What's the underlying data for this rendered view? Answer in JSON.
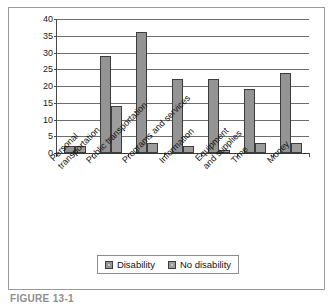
{
  "figure": {
    "caption": "FIGURE  13-1"
  },
  "chart_data": {
    "type": "bar",
    "title": "",
    "xlabel": "",
    "ylabel": "",
    "ylim": [
      0,
      40
    ],
    "ytick_step": 5,
    "ytick_labels": [
      "40",
      "35",
      "30",
      "25",
      "20",
      "15",
      "10",
      "5",
      "0"
    ],
    "grid": true,
    "legend_position": "bottom",
    "categories": [
      "Personal\ntransportation",
      "Public transportation",
      "Programs and services",
      "Information",
      "Equipment\nand supplies",
      "Time",
      "Money"
    ],
    "series": [
      {
        "name": "Disability",
        "color": "#949494",
        "values": [
          2,
          29,
          36,
          22,
          22,
          19,
          24
        ]
      },
      {
        "name": "No disability",
        "color": "#9c9c9c",
        "values": [
          2,
          14,
          3,
          2,
          1,
          3,
          3
        ]
      }
    ]
  },
  "legend": {
    "items": [
      {
        "label": "Disability"
      },
      {
        "label": "No disability"
      }
    ]
  }
}
